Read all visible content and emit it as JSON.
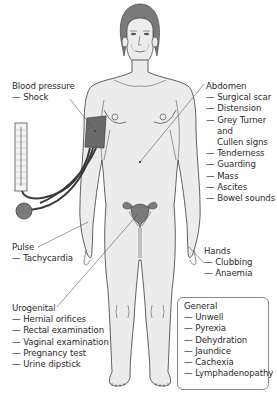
{
  "diagram": {
    "type": "anatomical-examination-diagram",
    "colors": {
      "body_fill": "#ececec",
      "outline": "#3a3a3a",
      "hair": "#7a7a7a",
      "cuff": "#6a6a6a",
      "bulb": "#7a7a7a",
      "leader_line": "#555555",
      "box_border": "#8a8a8a"
    }
  },
  "labels": {
    "blood_pressure": {
      "title": "Blood pressure",
      "items": [
        "— Shock"
      ]
    },
    "abdomen": {
      "title": "Abdomen",
      "items": [
        "— Surgical scar",
        "— Distension",
        "— Grey Turner",
        "and",
        "Cullen signs",
        "— Tenderness",
        "— Guarding",
        "— Mass",
        "— Ascites",
        "— Bowel sounds"
      ]
    },
    "pulse": {
      "title": "Pulse",
      "items": [
        "— Tachycardia"
      ]
    },
    "hands": {
      "title": "Hands",
      "items": [
        "— Clubbing",
        "— Anaemia"
      ]
    },
    "urogenital": {
      "title": "Urogenital",
      "items": [
        "— Hernial orifices",
        "— Rectal examination",
        "— Vaginal examination",
        "— Pregnancy test",
        "— Urine dipstick"
      ]
    },
    "general": {
      "title": "General",
      "items": [
        "— Unwell",
        "— Pyrexia",
        "— Dehydration",
        "— Jaundice",
        "— Cachexia",
        "— Lymphadenopathy"
      ]
    }
  }
}
